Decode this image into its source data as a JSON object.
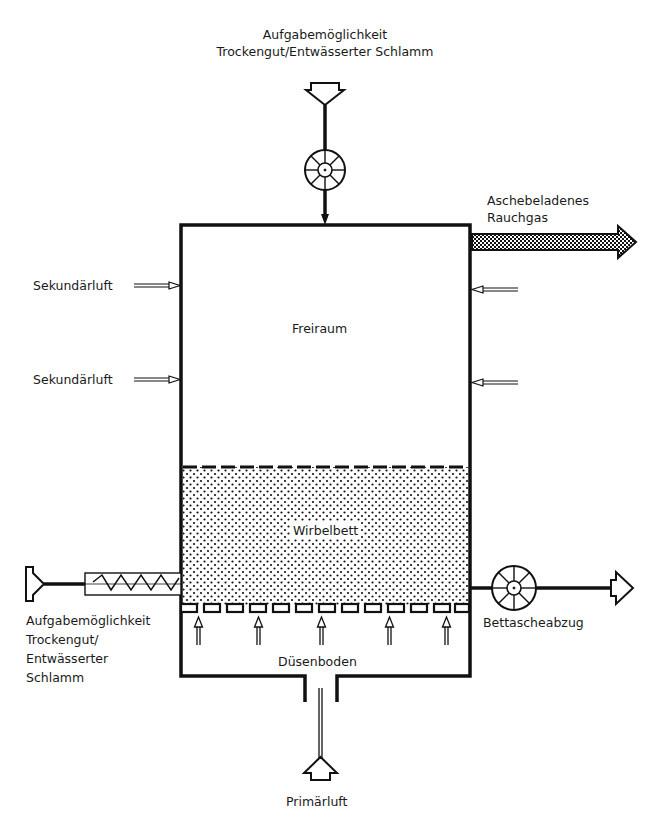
{
  "diagram": {
    "type": "fluidized-bed-incinerator-schematic",
    "colors": {
      "line": "#111111",
      "background": "#ffffff",
      "bed_fill": "#e8e8e8"
    },
    "labels": {
      "top_feed_line1": "Aufgabemöglichkeit",
      "top_feed_line2": "Trockengut/Entwässerter Schlamm",
      "flue_gas_line1": "Aschebeladenes",
      "flue_gas_line2": "Rauchgas",
      "secondary_air_1": "Sekundärluft",
      "secondary_air_2": "Sekundärluft",
      "freeboard": "Freiraum",
      "fluidized_bed": "Wirbelbett",
      "side_feed_line1": "Aufgabemöglichkeit",
      "side_feed_line2": "Trockengut/",
      "side_feed_line3": "Entwässerter",
      "side_feed_line4": "Schlamm",
      "bed_ash_removal": "Bettascheabzug",
      "nozzle_floor": "Düsenboden",
      "primary_air": "Primärluft"
    },
    "icons": {
      "top_rotary_valve": "rotary-valve-icon",
      "bottom_rotary_valve": "rotary-valve-icon",
      "screw_conveyor": "screw-conveyor-icon"
    },
    "nozzle_count": 13,
    "primary_air_arrow_count": 5
  }
}
